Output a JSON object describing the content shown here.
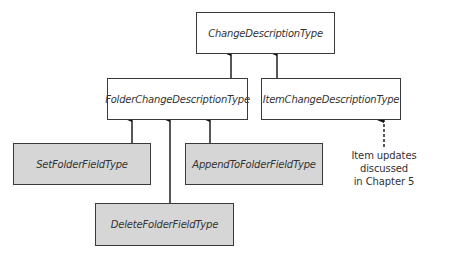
{
  "diagram": {
    "nodes": {
      "root": {
        "label": "ChangeDescriptionType",
        "fill": "#ffffff"
      },
      "folder": {
        "label": "FolderChangeDescriptionType",
        "fill": "#ffffff"
      },
      "item": {
        "label": "ItemChangeDescriptionType",
        "fill": "#ffffff"
      },
      "set_folder_field": {
        "label": "SetFolderFieldType",
        "fill": "#d6d6d6"
      },
      "append_folder_field": {
        "label": "AppendToFolderFieldType",
        "fill": "#d6d6d6"
      },
      "delete_folder_field": {
        "label": "DeleteFolderFieldType",
        "fill": "#d6d6d6"
      }
    },
    "edges": [
      {
        "from": "FolderChangeDescriptionType",
        "to": "ChangeDescriptionType",
        "style": "solid"
      },
      {
        "from": "ItemChangeDescriptionType",
        "to": "ChangeDescriptionType",
        "style": "solid"
      },
      {
        "from": "SetFolderFieldType",
        "to": "FolderChangeDescriptionType",
        "style": "solid"
      },
      {
        "from": "DeleteFolderFieldType",
        "to": "FolderChangeDescriptionType",
        "style": "solid"
      },
      {
        "from": "AppendToFolderFieldType",
        "to": "FolderChangeDescriptionType",
        "style": "solid"
      },
      {
        "from": "note",
        "to": "ItemChangeDescriptionType",
        "style": "dashed"
      }
    ],
    "note": {
      "line1": "Item updates discussed",
      "line2": "in Chapter 5"
    }
  }
}
